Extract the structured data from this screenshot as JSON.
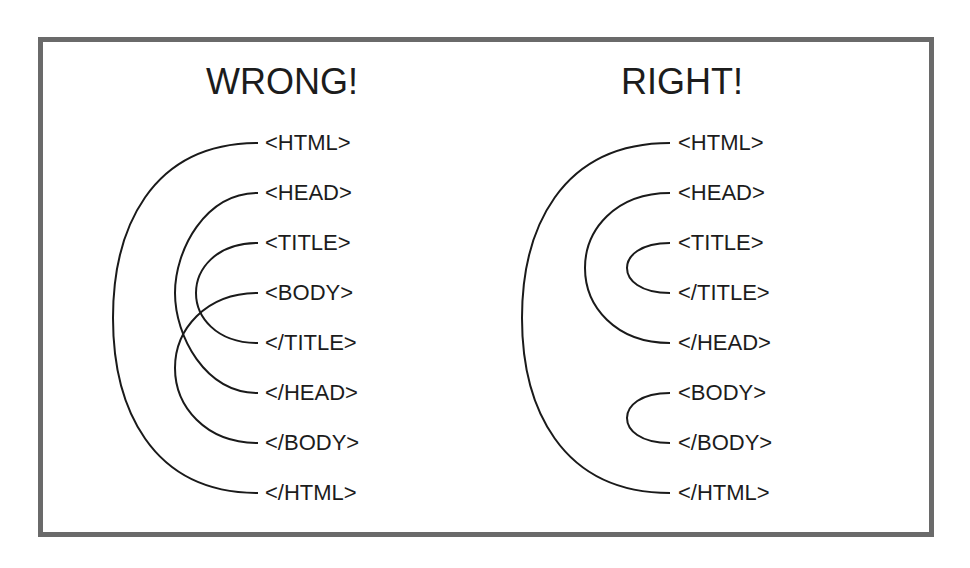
{
  "diagram": {
    "wrong": {
      "title": "WRONG!",
      "tags": [
        "<HTML>",
        "<HEAD>",
        "<TITLE>",
        "<BODY>",
        "</TITLE>",
        "</HEAD>",
        "</BODY>",
        "</HTML>"
      ],
      "pairs": [
        {
          "open": "<HTML>",
          "close": "</HTML>"
        },
        {
          "open": "<HEAD>",
          "close": "</HEAD>"
        },
        {
          "open": "<TITLE>",
          "close": "</TITLE>"
        },
        {
          "open": "<BODY>",
          "close": "</BODY>"
        }
      ]
    },
    "right": {
      "title": "RIGHT!",
      "tags": [
        "<HTML>",
        "<HEAD>",
        "<TITLE>",
        "</TITLE>",
        "</HEAD>",
        "<BODY>",
        "</BODY>",
        "</HTML>"
      ],
      "pairs": [
        {
          "open": "<HTML>",
          "close": "</HTML>"
        },
        {
          "open": "<HEAD>",
          "close": "</HEAD>"
        },
        {
          "open": "<TITLE>",
          "close": "</TITLE>"
        },
        {
          "open": "<BODY>",
          "close": "</BODY>"
        }
      ]
    },
    "colors": {
      "border": "#6a6a6a",
      "line": "#1a1a1a",
      "text": "#1c1c1c"
    }
  }
}
